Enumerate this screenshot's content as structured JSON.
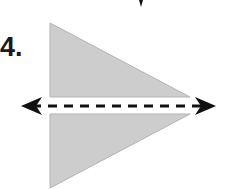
{
  "problem": {
    "number_label": "4.",
    "description": "Two congruent right triangles reflected across a dashed horizontal line of reflection with arrows at both ends"
  },
  "figure": {
    "shape_fill": "#cdcdcd",
    "shape_stroke": "#b0b0b0",
    "line_color": "#111111",
    "upper_triangle": {
      "points": "50,23 50,97 190,97"
    },
    "lower_triangle": {
      "points": "50,114 190,114 50,188"
    },
    "reflection_line": {
      "x1": 30,
      "x2": 205,
      "y": 106,
      "dash": "9 7"
    },
    "top_tick": {
      "x": 141,
      "y1": 0,
      "y2": 7
    }
  }
}
